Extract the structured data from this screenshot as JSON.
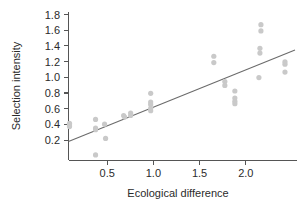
{
  "chart_data": {
    "type": "scatter",
    "title": "",
    "subtitle": "",
    "xlabel": "Ecological difference",
    "ylabel": "Selection intensity",
    "xlim": [
      0.0,
      2.28
    ],
    "ylim": [
      0.0,
      1.88
    ],
    "xticks": [
      0.5,
      1.0,
      1.5,
      2.0
    ],
    "xtick_labels": [
      "0.5",
      "1.0",
      "1.5",
      "2.0"
    ],
    "yticks": [
      0.2,
      0.4,
      0.6,
      0.8,
      1.0,
      1.2,
      1.4,
      1.6,
      1.8
    ],
    "ytick_labels": [
      "0.2",
      "0.4",
      "0.6",
      "0.8",
      "1.0",
      "1.2",
      "1.4",
      "1.6",
      "1.8"
    ],
    "grid": false,
    "legend": false,
    "legend_position": "none",
    "point_color": "#c9c9c9",
    "line_color": "#6b6b6b",
    "axis_color": "#555555",
    "points": [
      {
        "x": 0.01,
        "y": 0.47
      },
      {
        "x": 0.01,
        "y": 0.45
      },
      {
        "x": 0.01,
        "y": 0.43
      },
      {
        "x": 0.27,
        "y": 0.52
      },
      {
        "x": 0.27,
        "y": 0.41
      },
      {
        "x": 0.27,
        "y": 0.39
      },
      {
        "x": 0.27,
        "y": 0.07
      },
      {
        "x": 0.36,
        "y": 0.46
      },
      {
        "x": 0.37,
        "y": 0.28
      },
      {
        "x": 0.55,
        "y": 0.57
      },
      {
        "x": 0.56,
        "y": 0.55
      },
      {
        "x": 0.62,
        "y": 0.6
      },
      {
        "x": 0.62,
        "y": 0.57
      },
      {
        "x": 0.82,
        "y": 0.85
      },
      {
        "x": 0.82,
        "y": 0.74
      },
      {
        "x": 0.82,
        "y": 0.71
      },
      {
        "x": 0.82,
        "y": 0.66
      },
      {
        "x": 0.82,
        "y": 0.63
      },
      {
        "x": 1.45,
        "y": 1.32
      },
      {
        "x": 1.45,
        "y": 1.24
      },
      {
        "x": 1.56,
        "y": 1.0
      },
      {
        "x": 1.56,
        "y": 0.95
      },
      {
        "x": 1.66,
        "y": 0.88
      },
      {
        "x": 1.66,
        "y": 0.79
      },
      {
        "x": 1.66,
        "y": 0.75
      },
      {
        "x": 1.66,
        "y": 0.72
      },
      {
        "x": 1.92,
        "y": 1.72
      },
      {
        "x": 1.92,
        "y": 1.64
      },
      {
        "x": 1.91,
        "y": 1.42
      },
      {
        "x": 1.91,
        "y": 1.36
      },
      {
        "x": 1.9,
        "y": 1.05
      },
      {
        "x": 2.16,
        "y": 1.25
      },
      {
        "x": 2.16,
        "y": 1.22
      },
      {
        "x": 2.16,
        "y": 1.12
      }
    ],
    "fit_line": {
      "name": "regression line",
      "x_start": 0.0,
      "y_start": 0.24,
      "x_end": 2.26,
      "y_end": 1.4
    }
  }
}
